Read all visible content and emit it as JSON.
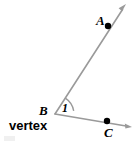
{
  "figure": {
    "background_color": "#ffffff",
    "line_color": "#9a9a9a",
    "arc_color": "#9a9a9a",
    "point_color": "#000000",
    "label_color": "#000000",
    "width": 137,
    "height": 142
  },
  "labels": {
    "point_a": "A",
    "point_b": "B",
    "point_c": "C",
    "angle_number": "1",
    "vertex_word": "vertex"
  },
  "geometry": {
    "vertex": {
      "name": "B",
      "x": 55,
      "y": 114
    },
    "points": [
      {
        "name": "A",
        "x": 108,
        "y": 26,
        "dot_radius": 3.2
      },
      {
        "name": "C",
        "x": 107,
        "y": 121,
        "dot_radius": 3.2
      }
    ],
    "rays": [
      {
        "name": "ray-BA",
        "from_x": 55,
        "from_y": 114,
        "to_x": 126,
        "to_y": 4,
        "arrowhead": true
      },
      {
        "name": "ray-BC",
        "from_x": 55,
        "from_y": 114,
        "to_x": 132,
        "to_y": 127,
        "arrowhead": true
      }
    ],
    "arc": {
      "name": "angle-arc-1",
      "center_x": 55,
      "center_y": 114,
      "radius": 19,
      "start_angle_deg": 57,
      "end_angle_deg": -9.6
    }
  }
}
